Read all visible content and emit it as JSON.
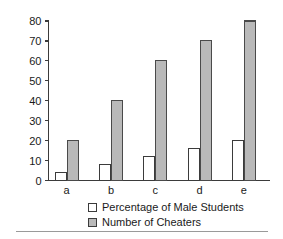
{
  "chart_data": {
    "type": "bar",
    "title": "",
    "subtitle": "",
    "xlabel": "",
    "ylabel": "",
    "categories": [
      "a",
      "b",
      "c",
      "d",
      "e"
    ],
    "series": [
      {
        "name": "Percentage of Male Students",
        "values": [
          4,
          8,
          12,
          16,
          20
        ],
        "style": "open",
        "color": "#ffffff",
        "edge_color": "#3b3b3b"
      },
      {
        "name": "Number of Cheaters",
        "values": [
          20,
          40,
          60,
          70,
          80
        ],
        "style": "filled",
        "color": "#b9b9b9",
        "edge_color": "#4a4a4a"
      }
    ],
    "ylim": [
      0,
      80
    ],
    "yticks": [
      0,
      10,
      20,
      30,
      40,
      50,
      60,
      70,
      80
    ],
    "ytick_labels": [
      "0",
      "10",
      "20",
      "30",
      "40",
      "50",
      "60",
      "70",
      "80"
    ],
    "grid": false,
    "legend_position": "below-axis-center",
    "axis_style": "left-and-bottom-spines-with-outward-ticks"
  },
  "legend": {
    "items": [
      {
        "label": "Percentage of Male Students",
        "swatch": "open-square-swatch"
      },
      {
        "label": "Number of Cheaters",
        "swatch": "filled-square-swatch"
      }
    ]
  },
  "axes": {
    "y_tick_labels": [
      "80",
      "70",
      "60",
      "50",
      "40",
      "30",
      "20",
      "10",
      "0"
    ],
    "x_tick_labels": [
      "a",
      "b",
      "c",
      "d",
      "e"
    ]
  }
}
